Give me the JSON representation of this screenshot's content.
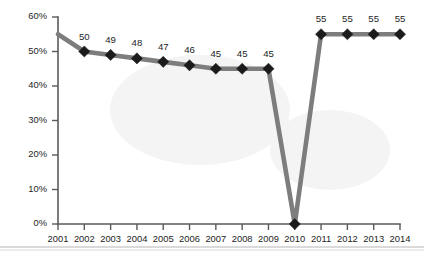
{
  "chart_data": {
    "type": "line",
    "title": "",
    "subtitle": "",
    "xlabel": "",
    "ylabel": "",
    "categories": [
      "2001",
      "2002",
      "2003",
      "2004",
      "2005",
      "2006",
      "2007",
      "2008",
      "2009",
      "2010",
      "2011",
      "2012",
      "2013",
      "2014"
    ],
    "values": [
      55,
      50,
      49,
      48,
      47,
      46,
      45,
      45,
      45,
      0,
      55,
      55,
      55,
      55
    ],
    "point_labels": [
      "",
      "50",
      "49",
      "48",
      "47",
      "46",
      "45",
      "45",
      "45",
      "",
      "55",
      "55",
      "55",
      "55"
    ],
    "markers": [
      false,
      true,
      true,
      true,
      true,
      true,
      true,
      true,
      true,
      true,
      true,
      true,
      true,
      true
    ],
    "ylim": [
      0,
      60
    ],
    "ytick_values": [
      0,
      10,
      20,
      30,
      40,
      50,
      60
    ],
    "ytick_labels": [
      "0%",
      "10%",
      "20%",
      "30%",
      "40%",
      "50%",
      "60%"
    ],
    "grid": false,
    "legend": null,
    "legend_position": "none",
    "series": [
      {
        "name": "series-1",
        "values": [
          55,
          50,
          49,
          48,
          47,
          46,
          45,
          45,
          45,
          0,
          55,
          55,
          55,
          55
        ],
        "line_color": "#7d7d7d",
        "marker_color": "#1b1b1b",
        "marker_shape": "diamond"
      }
    ]
  },
  "colors": {
    "line": "#7d7d7d",
    "marker": "#1b1b1b",
    "axis": "#5a5a5a",
    "label_text": "#242424",
    "background": "#ffffff"
  }
}
